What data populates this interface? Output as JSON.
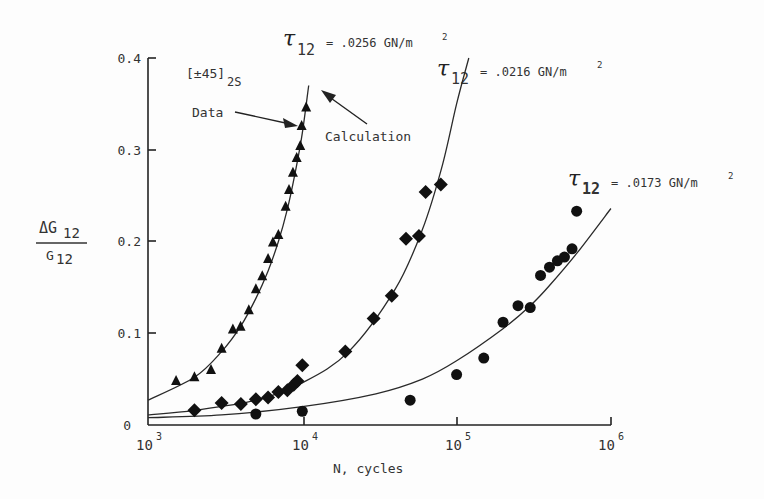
{
  "chart_data": {
    "type": "scatter",
    "title": "",
    "xlabel": "N, cycles",
    "ylabel": "ΔG12 / G12",
    "xscale": "log",
    "xlim": [
      1000,
      1000000
    ],
    "ylim": [
      0,
      0.4
    ],
    "x_ticks": [
      "10^3",
      "10^4",
      "10^5",
      "10^6"
    ],
    "y_ticks": [
      "0",
      "0.1",
      "0.2",
      "0.3",
      "0.4"
    ],
    "grid": false,
    "annotations": [
      "[±45]2S",
      "Data",
      "Calculation"
    ],
    "series": [
      {
        "name": "τ12 = .0256 GN/m²",
        "marker": "triangle",
        "x": [
          1520,
          2000,
          2560,
          3000,
          3550,
          3980,
          4500,
          5000,
          5500,
          6000,
          6450,
          7000,
          7800,
          8200,
          8700,
          9200,
          9700,
          9900,
          10600
        ],
        "y": [
          0.048,
          0.052,
          0.06,
          0.083,
          0.104,
          0.107,
          0.125,
          0.148,
          0.162,
          0.181,
          0.199,
          0.207,
          0.238,
          0.256,
          0.275,
          0.291,
          0.304,
          0.326,
          0.346
        ]
      },
      {
        "name": "τ12 = .0216 GN/m²",
        "marker": "diamond",
        "x": [
          2000,
          3000,
          4000,
          5000,
          6000,
          7000,
          8000,
          8800,
          9300,
          10000,
          19000,
          29000,
          38000,
          47000,
          57000,
          63000,
          79000
        ],
        "y": [
          0.016,
          0.024,
          0.023,
          0.028,
          0.03,
          0.036,
          0.038,
          0.044,
          0.048,
          0.065,
          0.08,
          0.116,
          0.141,
          0.203,
          0.206,
          0.254,
          0.262
        ]
      },
      {
        "name": "τ12 = .0173 GN/m²",
        "marker": "circle",
        "x": [
          5000,
          10000,
          50000,
          100000,
          150000,
          200000,
          250000,
          300000,
          350000,
          400000,
          450000,
          500000,
          560000,
          600000
        ],
        "y": [
          0.012,
          0.015,
          0.027,
          0.055,
          0.073,
          0.112,
          0.13,
          0.128,
          0.163,
          0.172,
          0.179,
          0.183,
          0.192,
          0.233
        ]
      }
    ],
    "curves": [
      {
        "name": "Calculation τ12=.0256",
        "x": [
          1000,
          2000,
          3000,
          4000,
          5000,
          6000,
          7000,
          8000,
          9000,
          10000,
          11000
        ],
        "y": [
          0.027,
          0.052,
          0.08,
          0.108,
          0.138,
          0.168,
          0.2,
          0.235,
          0.275,
          0.318,
          0.37
        ]
      },
      {
        "name": "Calculation τ12=.0216",
        "x": [
          1000,
          2000,
          5000,
          10000,
          20000,
          40000,
          60000,
          80000,
          100000,
          120000
        ],
        "y": [
          0.011,
          0.016,
          0.027,
          0.046,
          0.08,
          0.148,
          0.213,
          0.28,
          0.35,
          0.4
        ]
      },
      {
        "name": "Calculation τ12=.0173",
        "x": [
          1000,
          3000,
          10000,
          30000,
          60000,
          100000,
          200000,
          300000,
          400000,
          600000,
          1000000
        ],
        "y": [
          0.008,
          0.011,
          0.02,
          0.034,
          0.05,
          0.07,
          0.105,
          0.13,
          0.152,
          0.187,
          0.236
        ]
      }
    ]
  },
  "labels": {
    "ylabel_top": "ΔG",
    "ylabel_top_sub": "12",
    "ylabel_bottom": "G",
    "ylabel_bottom_sub": "12",
    "xlabel": "N, cycles",
    "layup": "[±45]",
    "layup_sub": "2S",
    "data_label": "Data",
    "calc_label": "Calculation",
    "tau_symbol": "τ",
    "tau_sub": "12",
    "tau1_value": "= .0256 GN/m",
    "tau2_value": "= .0216 GN/m",
    "tau3_value": "= .0173 GN/m",
    "sup2": "2",
    "yticks": [
      "0",
      "0.1",
      "0.2",
      "0.3",
      "0.4"
    ],
    "xtick_base": "10",
    "xtick_exps": [
      "3",
      "4",
      "5",
      "6"
    ]
  }
}
